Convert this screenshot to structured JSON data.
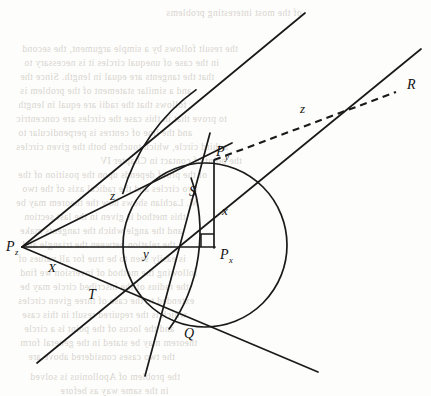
{
  "figure": {
    "stroke_color": "#1a1a1a",
    "background_color": "#fdfdfb",
    "points": [
      {
        "id": "Pz",
        "label": "P",
        "subscript": "z",
        "x": 22,
        "y": 247,
        "label_dx": -16,
        "label_dy": 4
      },
      {
        "id": "Py",
        "label": "P",
        "subscript": "y",
        "x": 214,
        "y": 160,
        "label_dx": 2,
        "label_dy": -4
      },
      {
        "id": "Px",
        "label": "P",
        "subscript": "x",
        "x": 214,
        "y": 247,
        "label_dx": 6,
        "label_dy": 12
      },
      {
        "id": "S",
        "label": "S",
        "subscript": "",
        "x": 186,
        "y": 184,
        "label_dx": 3,
        "label_dy": 12
      },
      {
        "id": "T",
        "label": "T",
        "subscript": "",
        "x": 86,
        "y": 285,
        "label_dx": 2,
        "label_dy": 14
      },
      {
        "id": "Q",
        "label": "Q",
        "subscript": "",
        "x": 182,
        "y": 322,
        "label_dx": 2,
        "label_dy": 16
      },
      {
        "id": "R",
        "label": "R",
        "subscript": "",
        "x": 399,
        "y": 91,
        "label_dx": 8,
        "label_dy": -2
      }
    ],
    "segment_labels": [
      {
        "id": "z-upper",
        "text": "z",
        "x": 110,
        "y": 200
      },
      {
        "id": "z-dashed",
        "text": "z",
        "x": 300,
        "y": 113
      },
      {
        "id": "x-vert",
        "text": "x",
        "x": 222,
        "y": 215
      },
      {
        "id": "y-horiz",
        "text": "y",
        "x": 143,
        "y": 258
      },
      {
        "id": "X-lower",
        "text": "X",
        "x": 48,
        "y": 272
      }
    ],
    "circle": {
      "center_x": 205,
      "center_y": 245,
      "radius": 82
    },
    "arc_through_S_Q": {
      "center_x": 32,
      "center_y": 232,
      "radius": 168
    },
    "arc_upper_left": {
      "center_x": 310,
      "center_y": 248,
      "radius": 195
    },
    "right_angle_marker": {
      "x": 214,
      "y": 247,
      "size": 13
    },
    "dashed_line": {
      "from_x": 214,
      "from_y": 160,
      "to_x": 396,
      "to_y": 92,
      "dash": "7 5"
    },
    "lines": [
      {
        "id": "tangent-upper",
        "x1": 22,
        "y1": 247,
        "x2": 305,
        "y2": 13
      },
      {
        "id": "tangent-lower",
        "x1": 22,
        "y1": 247,
        "x2": 318,
        "y2": 372
      },
      {
        "id": "chord-Pz-S",
        "x1": 22,
        "y1": 247,
        "x2": 232,
        "y2": 143
      },
      {
        "id": "chord-Pz-Px",
        "x1": 22,
        "y1": 247,
        "x2": 215,
        "y2": 247
      },
      {
        "id": "secant-T-R",
        "x1": 37,
        "y1": 363,
        "x2": 421,
        "y2": 49
      },
      {
        "id": "line-S-Q-ext",
        "x1": 210,
        "y1": 133,
        "x2": 145,
        "y2": 376
      },
      {
        "id": "vert-Py-Px",
        "x1": 214,
        "y1": 160,
        "x2": 214,
        "y2": 248
      }
    ]
  },
  "bleed_text": [
    {
      "text": "of the most interesting problems",
      "x": 166,
      "y": 8
    },
    {
      "text": "the result follows by a simple argument, the second",
      "x": 22,
      "y": 44
    },
    {
      "text": "in the case of unequal circles it is necessary to",
      "x": 24,
      "y": 58
    },
    {
      "text": "that the tangents are equal in length. Since the",
      "x": 20,
      "y": 72
    },
    {
      "text": "and a similar statement of the problem is",
      "x": 20,
      "y": 86
    },
    {
      "text": "follows that the radii are equal in length",
      "x": 18,
      "y": 100
    },
    {
      "text": "to prove that in this case the circles are concentric",
      "x": 16,
      "y": 114
    },
    {
      "text": "and the line of centres is perpendicular to",
      "x": 18,
      "y": 128
    },
    {
      "text": "a third circle, which touches both the given circles",
      "x": 16,
      "y": 142
    },
    {
      "text": "the point of contact in Chapter IV",
      "x": 100,
      "y": 156
    },
    {
      "text": "of the proof depends upon the position of the",
      "x": 18,
      "y": 170
    },
    {
      "text": "two circles and the radical axis of the two",
      "x": 22,
      "y": 184
    },
    {
      "text": "M. Lachlan shows how the theorem may be",
      "x": 16,
      "y": 198
    },
    {
      "text": "this method is given in the last section",
      "x": 24,
      "y": 212
    },
    {
      "text": "and the angle which the tangents make",
      "x": 20,
      "y": 226
    },
    {
      "text": "the relation between the triangle and",
      "x": 22,
      "y": 240
    },
    {
      "text": "is easily seen to be true for all values of",
      "x": 18,
      "y": 254
    },
    {
      "text": "following the method of inversion we find",
      "x": 20,
      "y": 268
    },
    {
      "text": "the radius of the inscribed circle may be",
      "x": 20,
      "y": 282
    },
    {
      "text": "extended to the case of three given circles",
      "x": 18,
      "y": 296
    },
    {
      "text": "which is the required result in this case",
      "x": 22,
      "y": 310
    },
    {
      "text": "and the locus of the point is a circle",
      "x": 24,
      "y": 324
    },
    {
      "text": "theorem may be stated in the general form",
      "x": 20,
      "y": 338
    },
    {
      "text": "the two cases considered above are",
      "x": 28,
      "y": 352
    },
    {
      "text": "the problem of Apollonius is solved",
      "x": 30,
      "y": 372
    },
    {
      "text": "in the same way as before",
      "x": 60,
      "y": 386
    }
  ]
}
